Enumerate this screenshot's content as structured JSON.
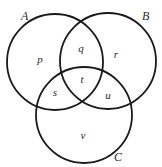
{
  "diagram": {
    "type": "venn",
    "sets": [
      {
        "id": "A",
        "label": "A",
        "cx": 55,
        "cy": 62,
        "r": 48,
        "label_x": 21,
        "label_y": 20
      },
      {
        "id": "B",
        "label": "B",
        "cx": 108,
        "cy": 61,
        "r": 48,
        "label_x": 142,
        "label_y": 20
      },
      {
        "id": "C",
        "label": "C",
        "cx": 84,
        "cy": 115,
        "r": 48,
        "label_x": 114,
        "label_y": 161
      }
    ],
    "regions": [
      {
        "id": "p",
        "label": "p",
        "members": [
          "A"
        ],
        "x": 40,
        "y": 63
      },
      {
        "id": "q",
        "label": "q",
        "members": [
          "A",
          "B"
        ],
        "x": 81,
        "y": 52
      },
      {
        "id": "r",
        "label": "r",
        "members": [
          "B"
        ],
        "x": 116,
        "y": 58
      },
      {
        "id": "t",
        "label": "t",
        "members": [
          "A",
          "B",
          "C"
        ],
        "x": 82,
        "y": 83
      },
      {
        "id": "s",
        "label": "s",
        "members": [
          "A",
          "C"
        ],
        "x": 55,
        "y": 96
      },
      {
        "id": "u",
        "label": "u",
        "members": [
          "B",
          "C"
        ],
        "x": 108,
        "y": 99
      },
      {
        "id": "v",
        "label": "v",
        "members": [
          "C"
        ],
        "x": 83,
        "y": 139
      }
    ],
    "stroke_color": "#1a1a1a",
    "label_color": "#2a2a2a"
  }
}
